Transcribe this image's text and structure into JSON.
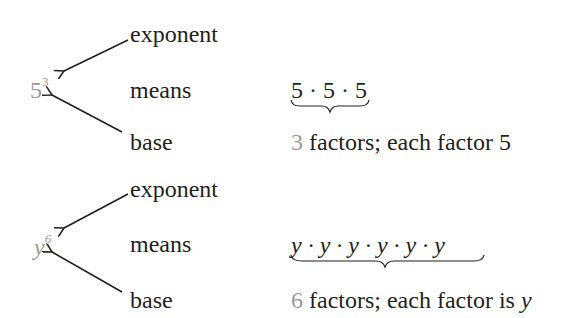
{
  "examples": [
    {
      "base": "5",
      "exponent": "3",
      "base_italic": false,
      "label_exponent": "exponent",
      "label_means": "means",
      "label_base": "base",
      "expansion": "5 · 5 · 5",
      "count": "3",
      "description_middle": " factors; each factor ",
      "description_value": "5",
      "description_value_italic": false
    },
    {
      "base": "y",
      "exponent": "6",
      "base_italic": true,
      "label_exponent": "exponent",
      "label_means": "means",
      "label_base": "base",
      "expansion": "y · y · y · y · y · y",
      "count": "6",
      "description_middle": " factors; each factor is ",
      "description_value": "y",
      "description_value_italic": true
    }
  ],
  "colors": {
    "text": "#231f20",
    "highlight_grey": "#9a9a9a"
  }
}
